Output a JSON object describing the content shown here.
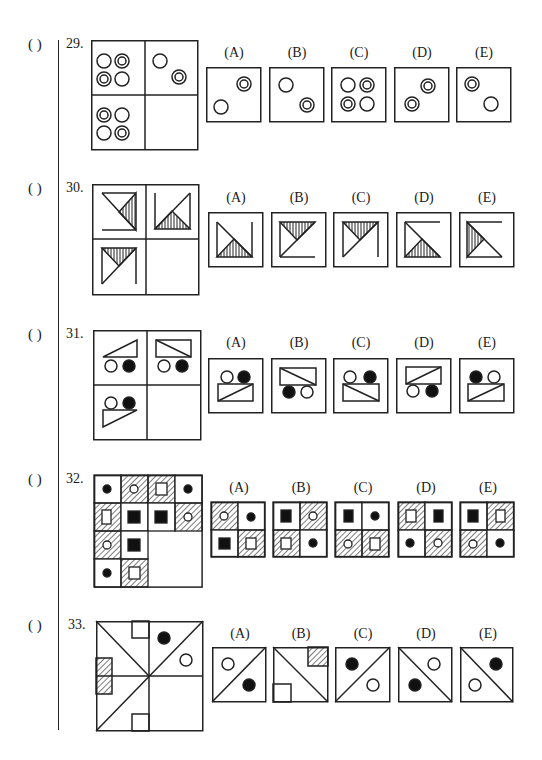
{
  "page": {
    "blank_paren": "(   )",
    "questions": [
      {
        "number": "29.",
        "options": [
          "(A)",
          "(B)",
          "(C)",
          "(D)",
          "(E)"
        ],
        "grid": {
          "x": 91,
          "y": 40,
          "w": 107,
          "h": 110
        },
        "option_boxes": {
          "y": 67,
          "size": 55,
          "xs": [
            206,
            269,
            331,
            394,
            456
          ]
        },
        "label_y": 45
      },
      {
        "number": "30.",
        "options": [
          "(A)",
          "(B)",
          "(C)",
          "(D)",
          "(E)"
        ],
        "grid": {
          "x": 92,
          "y": 184,
          "w": 107,
          "h": 111
        },
        "option_boxes": {
          "y": 212,
          "size": 55,
          "xs": [
            208,
            271,
            333,
            396,
            459
          ]
        },
        "label_y": 190
      },
      {
        "number": "31.",
        "options": [
          "(A)",
          "(B)",
          "(C)",
          "(D)",
          "(E)"
        ],
        "grid": {
          "x": 93,
          "y": 330,
          "w": 108,
          "h": 110
        },
        "option_boxes": {
          "y": 357,
          "size": 55,
          "xs": [
            208,
            271,
            333,
            396,
            459
          ]
        },
        "label_y": 335
      },
      {
        "number": "32.",
        "options": [
          "(A)",
          "(B)",
          "(C)",
          "(D)",
          "(E)"
        ],
        "grid": {
          "x": 94,
          "y": 475,
          "w": 108,
          "h": 112
        },
        "option_boxes": {
          "y": 501,
          "size": 54,
          "xs": [
            211,
            273,
            335,
            398,
            460
          ]
        },
        "label_y": 480
      },
      {
        "number": "33.",
        "options": [
          "(A)",
          "(B)",
          "(C)",
          "(D)",
          "(E)"
        ],
        "grid": {
          "x": 96,
          "y": 621,
          "w": 107,
          "h": 110
        },
        "option_boxes": {
          "y": 647,
          "size": 54,
          "xs": [
            212,
            273,
            335,
            398,
            460
          ]
        },
        "label_y": 627
      }
    ]
  }
}
